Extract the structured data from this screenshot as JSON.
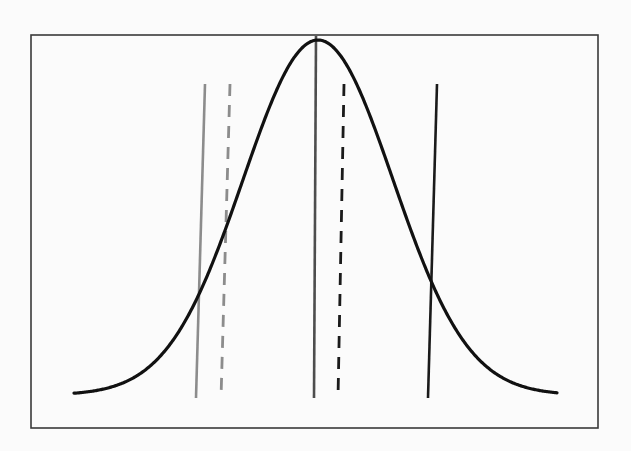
{
  "diagram": {
    "type": "normal-distribution-with-reference-lines",
    "canvas": {
      "width": 631,
      "height": 451,
      "background": "#fbfbfb"
    },
    "frame": {
      "x": 31,
      "y": 35,
      "width": 567,
      "height": 393,
      "stroke": "#3a3a3a",
      "stroke_width": 1.6
    },
    "curve": {
      "name": "bell-curve",
      "stroke": "#111111",
      "stroke_width": 3.2,
      "x_start": 74,
      "x_end": 557,
      "baseline_y": 395,
      "peak_x": 318,
      "peak_y": 40,
      "sigma_px": 75
    },
    "lines": [
      {
        "name": "gray-solid-line",
        "x1": 205,
        "y1": 84,
        "x2": 196,
        "y2": 398,
        "stroke": "#8c8c8c",
        "width": 2.6,
        "dashed": false
      },
      {
        "name": "gray-dashed-line",
        "x1": 230,
        "y1": 84,
        "x2": 221,
        "y2": 398,
        "stroke": "#8c8c8c",
        "width": 2.8,
        "dashed": true
      },
      {
        "name": "center-solid-line",
        "x1": 316,
        "y1": 36,
        "x2": 314,
        "y2": 398,
        "stroke": "#4d4d4d",
        "width": 2.6,
        "dashed": false
      },
      {
        "name": "black-dashed-line",
        "x1": 344,
        "y1": 84,
        "x2": 338,
        "y2": 398,
        "stroke": "#1a1a1a",
        "width": 2.8,
        "dashed": true
      },
      {
        "name": "black-solid-line",
        "x1": 437,
        "y1": 84,
        "x2": 428,
        "y2": 398,
        "stroke": "#1a1a1a",
        "width": 2.6,
        "dashed": false
      }
    ],
    "dash_pattern": "12,9"
  }
}
